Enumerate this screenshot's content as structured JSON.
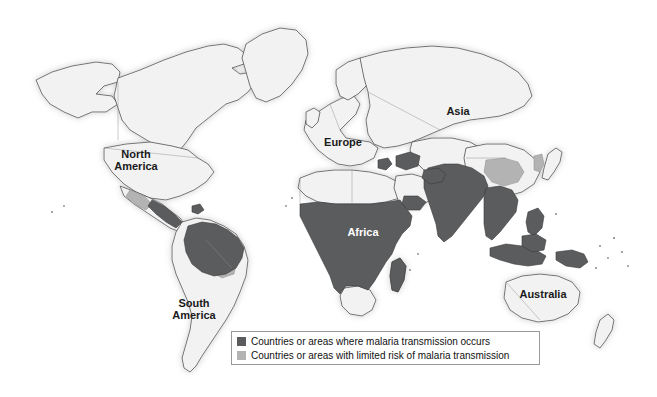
{
  "figure": {
    "type": "thematic-world-map",
    "background_color": "#ffffff"
  },
  "map": {
    "projection_note": "world map, equirectangular-style",
    "continent_labels": [
      {
        "id": "north-america",
        "text": "North\nAmerica",
        "on_dark": false
      },
      {
        "id": "south-america",
        "text": "South\nAmerica",
        "on_dark": false
      },
      {
        "id": "europe",
        "text": "Europe",
        "on_dark": false
      },
      {
        "id": "asia",
        "text": "Asia",
        "on_dark": false
      },
      {
        "id": "africa",
        "text": "Africa",
        "on_dark": true
      },
      {
        "id": "australia",
        "text": "Australia",
        "on_dark": false
      }
    ],
    "colors": {
      "transmission_dark": "#5b5c5e",
      "limited_risk_gray": "#b3b3b3",
      "no_risk_land": "#f2f2f2",
      "coastline": "#3a3a3a",
      "border": "#8d8d8d",
      "ocean": "#ffffff",
      "halo": "#d8d8d8"
    },
    "regions": {
      "transmission": [
        "Sub-Saharan Africa",
        "South Asia",
        "Southeast Asia",
        "Indonesia",
        "Papua New Guinea",
        "Amazon Basin",
        "Central America",
        "Caucasus and Middle East pockets"
      ],
      "limited_risk": [
        "Southern China",
        "Korean Peninsula",
        "parts of Bolivia and Paraguay",
        "Mexico border areas"
      ],
      "no_risk": [
        "North America",
        "Europe",
        "Russia",
        "North Africa",
        "Southern Africa",
        "Australia",
        "New Zealand",
        "Japan"
      ]
    }
  },
  "legend": {
    "items": [
      {
        "swatch_color": "#5b5c5e",
        "label": "Countries or areas where malaria transmission occurs"
      },
      {
        "swatch_color": "#b3b3b3",
        "label": "Countries or areas with limited risk of malaria transmission"
      }
    ]
  }
}
